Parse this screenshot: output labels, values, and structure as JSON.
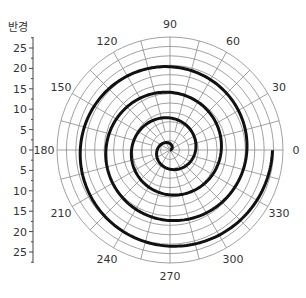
{
  "chart_data": {
    "type": "line",
    "subtype": "polar",
    "title": "",
    "radial_axis_label": "반경",
    "radial_ticks": [
      0,
      5,
      10,
      15,
      20,
      25
    ],
    "radial_range": [
      0,
      27.7
    ],
    "angular_ticks": [
      0,
      30,
      60,
      90,
      120,
      150,
      180,
      210,
      240,
      270,
      300,
      330
    ],
    "angular_unit": "degrees",
    "grid": true,
    "series": [
      {
        "name": "spiral",
        "equation": "r = theta (radians)",
        "theta_range_rad": [
          0,
          25.13
        ],
        "turns": 4,
        "color": "#111111",
        "sample_points": [
          {
            "theta_deg": 0,
            "r": 0
          },
          {
            "theta_deg": 180,
            "r": 3.14
          },
          {
            "theta_deg": 360,
            "r": 6.28
          },
          {
            "theta_deg": 540,
            "r": 9.42
          },
          {
            "theta_deg": 720,
            "r": 12.57
          },
          {
            "theta_deg": 900,
            "r": 15.71
          },
          {
            "theta_deg": 1080,
            "r": 18.85
          },
          {
            "theta_deg": 1260,
            "r": 21.99
          },
          {
            "theta_deg": 1440,
            "r": 25.13
          }
        ]
      }
    ],
    "colors": {
      "grid": "#8a8a8a",
      "line": "#111111",
      "text": "#333333"
    }
  },
  "labels": {
    "radial_axis_title": "반경",
    "radial_tick_labels_upper": [
      "25",
      "20",
      "15",
      "10",
      "5",
      "0"
    ],
    "radial_tick_labels_lower": [
      "5",
      "10",
      "15",
      "20",
      "25"
    ],
    "angle_labels": [
      "0",
      "30",
      "60",
      "90",
      "120",
      "150",
      "180",
      "210",
      "240",
      "270",
      "300",
      "330"
    ]
  }
}
